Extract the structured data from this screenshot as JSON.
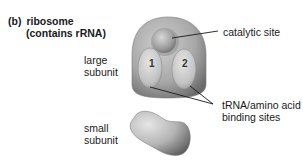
{
  "figure": {
    "panel_letter": "(b)",
    "title_line1": "ribosome",
    "title_line2": "(contains rRNA)"
  },
  "labels": {
    "large_subunit_line1": "large",
    "large_subunit_line2": "subunit",
    "small_subunit_line1": "small",
    "small_subunit_line2": "subunit",
    "catalytic_site": "catalytic site",
    "binding_sites_line1": "tRNA/amino acid",
    "binding_sites_line2": "binding sites"
  },
  "site_numbers": {
    "site1": "1",
    "site2": "2"
  },
  "colors": {
    "subunit_light": "#d9d9d9",
    "subunit_mid": "#a6a6a6",
    "subunit_dark": "#6e6e6e",
    "leader_line": "#1a1a1a"
  }
}
